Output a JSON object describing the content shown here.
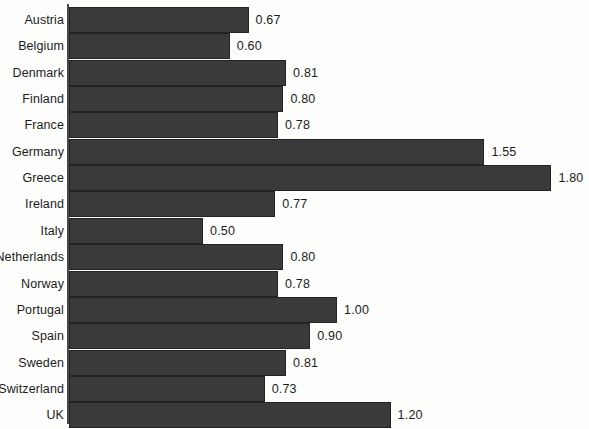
{
  "chart_data": {
    "type": "bar",
    "orientation": "horizontal",
    "title": "",
    "subtitle": "",
    "xlabel": "",
    "ylabel": "",
    "grid": false,
    "legend": false,
    "xlim": [
      0,
      1.95
    ],
    "axis_ticks": [],
    "value_label_format": "0.00",
    "categories": [
      "Austria",
      "Belgium",
      "Denmark",
      "Finland",
      "France",
      "Germany",
      "Greece",
      "Ireland",
      "Italy",
      "Netherlands",
      "Norway",
      "Portugal",
      "Spain",
      "Sweden",
      "Switzerland",
      "UK"
    ],
    "values": [
      0.67,
      0.6,
      0.81,
      0.8,
      0.78,
      1.55,
      1.8,
      0.77,
      0.5,
      0.8,
      0.78,
      1.0,
      0.9,
      0.81,
      0.73,
      1.2
    ],
    "value_labels": [
      "0.67",
      "0.60",
      "0.81",
      "0.80",
      "0.78",
      "1.55",
      "1.80",
      "0.77",
      "0.50",
      "0.80",
      "0.78",
      "1.00",
      "0.90",
      "0.81",
      "0.73",
      "1.20"
    ],
    "colors": {
      "bar_fill": "#3a3a3a",
      "bar_stroke": "#232323",
      "axis": "#4a4a4a",
      "text": "#1c1c1c",
      "background": "#fdfdfc"
    }
  },
  "layout": {
    "axis_x": 69,
    "px_per_unit": 268,
    "bar_height": 26,
    "row_pitch": 26.35,
    "first_row_top": 7,
    "value_label_gap": 7
  }
}
